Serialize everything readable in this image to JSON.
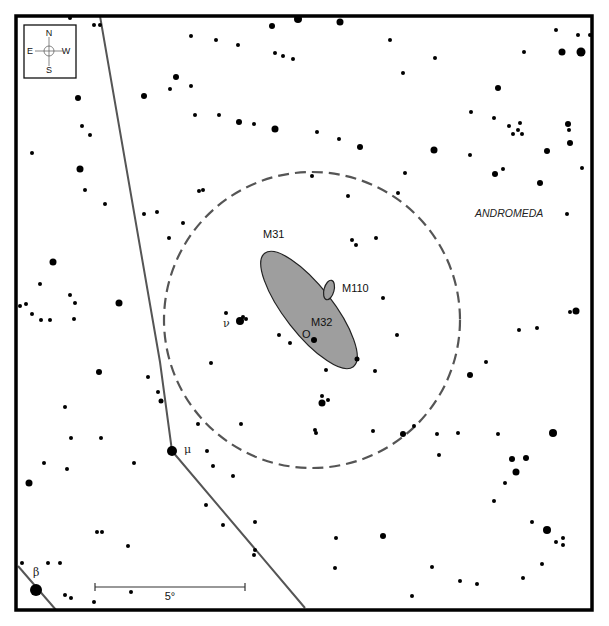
{
  "chart_data": {
    "type": "scatter",
    "constellation_label": "ANDROMEDA",
    "compass": {
      "N": "N",
      "S": "S",
      "E": "E",
      "W": "W"
    },
    "scale_bar": {
      "label": "5°",
      "x1": 95,
      "x2": 245,
      "y": 587
    },
    "frame": {
      "x": 16,
      "y": 16,
      "w": 576,
      "h": 594
    },
    "finder_circle": {
      "cx": 312,
      "cy": 320,
      "r": 148,
      "style": "dashed"
    },
    "galaxies": [
      {
        "name": "M31",
        "label": "M31",
        "cx": 309,
        "cy": 310,
        "rx": 72,
        "ry": 24,
        "angle": 52,
        "label_x": 263,
        "label_y": 238
      },
      {
        "name": "M110",
        "label": "M110",
        "cx": 329,
        "cy": 290,
        "rx": 5,
        "ry": 10,
        "angle": 15,
        "label_x": 342,
        "label_y": 292
      },
      {
        "name": "M32",
        "label": "M32",
        "cx": 314,
        "cy": 340,
        "label_x": 311,
        "label_y": 326
      },
      {
        "name": "O",
        "label": "O",
        "label_x": 302,
        "label_y": 338
      }
    ],
    "named_stars": [
      {
        "label": "ν",
        "x": 240,
        "y": 321,
        "r": 4,
        "label_x": 223,
        "label_y": 327
      },
      {
        "label": "μ",
        "x": 172,
        "y": 451,
        "r": 5,
        "label_x": 184,
        "label_y": 453
      },
      {
        "label": "β",
        "x": 36,
        "y": 590,
        "r": 6,
        "label_x": 33,
        "label_y": 576
      }
    ],
    "constellation_lines": [
      {
        "points": [
          [
            100,
            16
          ],
          [
            160,
            362
          ],
          [
            172,
            451
          ],
          [
            305,
            608
          ]
        ]
      },
      {
        "points": [
          [
            18,
            566
          ],
          [
            56,
            610
          ]
        ]
      }
    ],
    "stars": [
      [
        70,
        18,
        2
      ],
      [
        94,
        25,
        2
      ],
      [
        100,
        25,
        2
      ],
      [
        298,
        19,
        4
      ],
      [
        340,
        22,
        3.5
      ],
      [
        191,
        36,
        2
      ],
      [
        216,
        40,
        2
      ],
      [
        238,
        45,
        2
      ],
      [
        272,
        26,
        3
      ],
      [
        275,
        53,
        2
      ],
      [
        283,
        56,
        2
      ],
      [
        293,
        59,
        2
      ],
      [
        176,
        77,
        3
      ],
      [
        170,
        89,
        2
      ],
      [
        191,
        86,
        2
      ],
      [
        144,
        96,
        3
      ],
      [
        195,
        115,
        2
      ],
      [
        219,
        115,
        2
      ],
      [
        239,
        122,
        3
      ],
      [
        254,
        124,
        2
      ],
      [
        275,
        129,
        3.5
      ],
      [
        317,
        132,
        2
      ],
      [
        339,
        139,
        2
      ],
      [
        403,
        73,
        2
      ],
      [
        390,
        40,
        2
      ],
      [
        435,
        58,
        2
      ],
      [
        524,
        52,
        2
      ],
      [
        556,
        30,
        2
      ],
      [
        562,
        52,
        3.5
      ],
      [
        581,
        52,
        4.5
      ],
      [
        590,
        35,
        2
      ],
      [
        578,
        35,
        2
      ],
      [
        498,
        88,
        3
      ],
      [
        471,
        112,
        2
      ],
      [
        494,
        118,
        2
      ],
      [
        509,
        126,
        2
      ],
      [
        518,
        130,
        2
      ],
      [
        513,
        134,
        2
      ],
      [
        522,
        134,
        2
      ],
      [
        520,
        123,
        2
      ],
      [
        568,
        124,
        3
      ],
      [
        569,
        130,
        2
      ],
      [
        570,
        143,
        3
      ],
      [
        547,
        151,
        3
      ],
      [
        582,
        168,
        2
      ],
      [
        360,
        147,
        3
      ],
      [
        434,
        150,
        3.5
      ],
      [
        470,
        155,
        2
      ],
      [
        495,
        174,
        3
      ],
      [
        540,
        183,
        3
      ],
      [
        503,
        169,
        2
      ],
      [
        405,
        173,
        2
      ],
      [
        398,
        193,
        2
      ],
      [
        348,
        196,
        2
      ],
      [
        567,
        214,
        2
      ],
      [
        78,
        98,
        3
      ],
      [
        82,
        126,
        2
      ],
      [
        90,
        135,
        2
      ],
      [
        32,
        153,
        2
      ],
      [
        80,
        169,
        3.5
      ],
      [
        53,
        262,
        3.5
      ],
      [
        85,
        190,
        2
      ],
      [
        105,
        204,
        2
      ],
      [
        144,
        214,
        2
      ],
      [
        157,
        212,
        2
      ],
      [
        183,
        223,
        2
      ],
      [
        169,
        238,
        2
      ],
      [
        199,
        191,
        2
      ],
      [
        203,
        190,
        2
      ],
      [
        312,
        176,
        2
      ],
      [
        40,
        284,
        2
      ],
      [
        70,
        295,
        2
      ],
      [
        26,
        304,
        2
      ],
      [
        20,
        306,
        2
      ],
      [
        75,
        303,
        2
      ],
      [
        74,
        319,
        2
      ],
      [
        41,
        320,
        2
      ],
      [
        50,
        320,
        2
      ],
      [
        119,
        303,
        3.5
      ],
      [
        32,
        314,
        2
      ],
      [
        352,
        240,
        2
      ],
      [
        376,
        238,
        2
      ],
      [
        356,
        245,
        2
      ],
      [
        383,
        298,
        2
      ],
      [
        397,
        335,
        2
      ],
      [
        375,
        371,
        2
      ],
      [
        470,
        375,
        3
      ],
      [
        486,
        362,
        2
      ],
      [
        570,
        312,
        2
      ],
      [
        576,
        311,
        3.5
      ],
      [
        519,
        330,
        2
      ],
      [
        537,
        328,
        2
      ],
      [
        226,
        313,
        2
      ],
      [
        246,
        319,
        2
      ],
      [
        243,
        317,
        2
      ],
      [
        279,
        335,
        2
      ],
      [
        290,
        343,
        2
      ],
      [
        314,
        340,
        3
      ],
      [
        357,
        359,
        2.5
      ],
      [
        326,
        370,
        2
      ],
      [
        211,
        363,
        2
      ],
      [
        99,
        372,
        3
      ],
      [
        148,
        377,
        2
      ],
      [
        161,
        401,
        2.5
      ],
      [
        158,
        392,
        2
      ],
      [
        65,
        407,
        2
      ],
      [
        71,
        438,
        2
      ],
      [
        101,
        438,
        2
      ],
      [
        44,
        463,
        2
      ],
      [
        67,
        469,
        2
      ],
      [
        29,
        483,
        3.5
      ],
      [
        134,
        463,
        2
      ],
      [
        207,
        451,
        2
      ],
      [
        213,
        466,
        2
      ],
      [
        198,
        424,
        2
      ],
      [
        233,
        476,
        2
      ],
      [
        241,
        424,
        2
      ],
      [
        206,
        505,
        2
      ],
      [
        223,
        525,
        2
      ],
      [
        255,
        550,
        2
      ],
      [
        316,
        433,
        2
      ],
      [
        322,
        396,
        2
      ],
      [
        328,
        400,
        2
      ],
      [
        322,
        403,
        3.5
      ],
      [
        315,
        430,
        2
      ],
      [
        373,
        431,
        2
      ],
      [
        403,
        434,
        3
      ],
      [
        414,
        426,
        2
      ],
      [
        437,
        434,
        2
      ],
      [
        458,
        433,
        2
      ],
      [
        498,
        434,
        2
      ],
      [
        553,
        433,
        4
      ],
      [
        512,
        459,
        3
      ],
      [
        526,
        458,
        3
      ],
      [
        516,
        472,
        3.5
      ],
      [
        505,
        483,
        2
      ],
      [
        494,
        501,
        2
      ],
      [
        532,
        522,
        2
      ],
      [
        547,
        530,
        4
      ],
      [
        556,
        542,
        2
      ],
      [
        563,
        545,
        2
      ],
      [
        563,
        538,
        2
      ],
      [
        542,
        564,
        2
      ],
      [
        523,
        578,
        2
      ],
      [
        460,
        581,
        2
      ],
      [
        477,
        584,
        2
      ],
      [
        412,
        596,
        2
      ],
      [
        439,
        455,
        2
      ],
      [
        432,
        567,
        2
      ],
      [
        383,
        536,
        3
      ],
      [
        97,
        532,
        2
      ],
      [
        102,
        532,
        2
      ],
      [
        128,
        546,
        2
      ],
      [
        65,
        595,
        2
      ],
      [
        71,
        598,
        2
      ],
      [
        94,
        602,
        2
      ],
      [
        131,
        592,
        2
      ],
      [
        254,
        555,
        2
      ],
      [
        255,
        522,
        2
      ],
      [
        22,
        563,
        2
      ],
      [
        48,
        563,
        2
      ],
      [
        60,
        563,
        2
      ],
      [
        335,
        568,
        2
      ],
      [
        336,
        538,
        2
      ]
    ]
  }
}
